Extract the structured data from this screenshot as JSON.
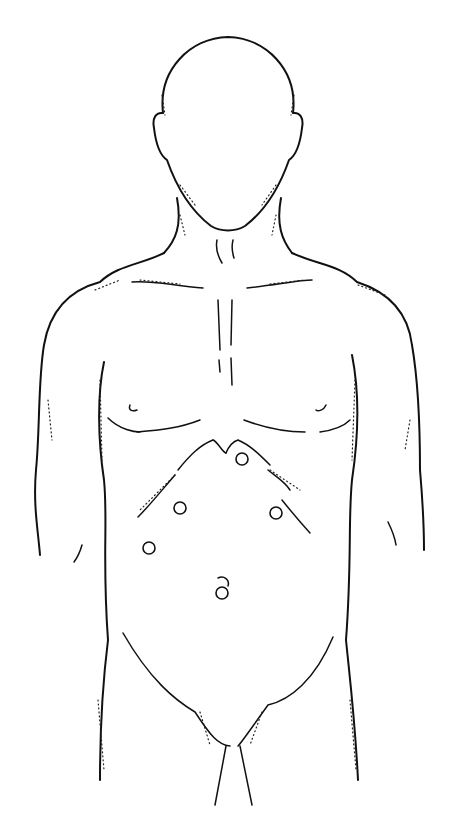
{
  "figure": {
    "line_color": "#111111",
    "background": "#ffffff",
    "ports": [
      {
        "id": "port-1",
        "cx": 242,
        "cy": 459,
        "r": 6
      },
      {
        "id": "port-2",
        "cx": 180,
        "cy": 508,
        "r": 6
      },
      {
        "id": "port-3",
        "cx": 276,
        "cy": 513,
        "r": 6
      },
      {
        "id": "port-4",
        "cx": 149,
        "cy": 548,
        "r": 6
      },
      {
        "id": "port-5",
        "cx": 222,
        "cy": 593,
        "r": 6
      }
    ]
  }
}
